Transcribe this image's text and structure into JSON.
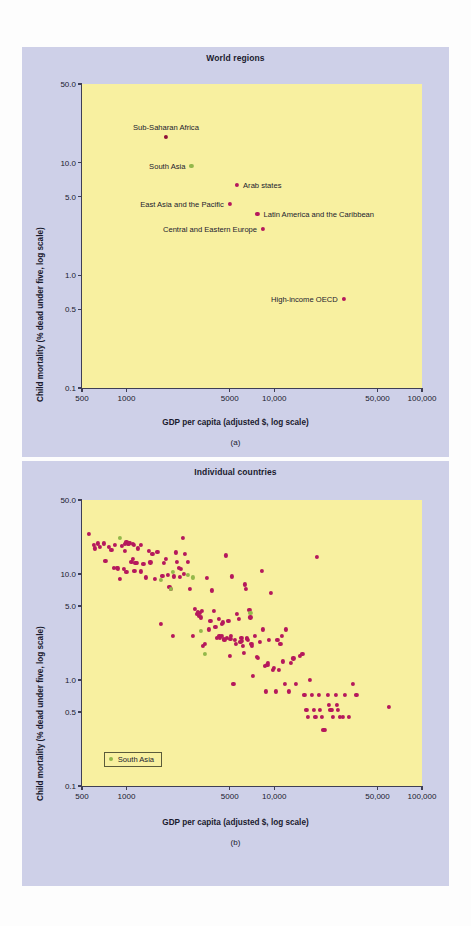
{
  "figure": {
    "background_color": "#fdfdfd",
    "panel_color": "#ced0e8",
    "plot_color": "#f8f0a0",
    "accent_red": "#b5185c",
    "accent_green": "#93b84a"
  },
  "panel_a": {
    "title": "World regions",
    "caption": "(a)",
    "xlabel": "GDP per capita (adjusted $, log scale)",
    "ylabel": "Child mortality (% dead under five, log scale)"
  },
  "panel_b": {
    "title": "Individual countries",
    "caption": "(b)",
    "xlabel": "GDP per capita (adjusted $, log scale)",
    "ylabel": "Child mortality (% dead under five, log scale)",
    "legend_label": "South Asia"
  },
  "axes": {
    "x_ticks": [
      {
        "value": 500,
        "label": "500"
      },
      {
        "value": 1000,
        "label": "1000"
      },
      {
        "value": 5000,
        "label": "5000"
      },
      {
        "value": 10000,
        "label": "10,000"
      },
      {
        "value": 50000,
        "label": "50,000"
      },
      {
        "value": 100000,
        "label": "100,000"
      }
    ],
    "y_ticks": [
      {
        "value": 50.0,
        "label": "50.0"
      },
      {
        "value": 10.0,
        "label": "10.0"
      },
      {
        "value": 5.0,
        "label": "5.0"
      },
      {
        "value": 1.0,
        "label": "1.0"
      },
      {
        "value": 0.5,
        "label": "0.5"
      },
      {
        "value": 0.1,
        "label": "0.1"
      }
    ],
    "xlim": [
      500,
      100000
    ],
    "ylim": [
      0.1,
      50.0
    ],
    "xscale": "log",
    "yscale": "log",
    "grid": false
  },
  "chart_data": [
    {
      "type": "scatter",
      "title": "World regions",
      "xlabel": "GDP per capita (adjusted $, log scale)",
      "ylabel": "Child mortality (% dead under five, log scale)",
      "xscale": "log",
      "yscale": "log",
      "xlim": [
        500,
        100000
      ],
      "ylim": [
        0.1,
        50.0
      ],
      "grid": false,
      "legend": null,
      "points": [
        {
          "label": "Sub-Saharan Africa",
          "x": 1850,
          "y": 17.0,
          "color": "#8f1038",
          "label_pos": "above"
        },
        {
          "label": "South Asia",
          "x": 2750,
          "y": 9.3,
          "color": "#93b84a",
          "label_pos": "left"
        },
        {
          "label": "Arab states",
          "x": 5600,
          "y": 6.4,
          "color": "#b5185c",
          "label_pos": "right"
        },
        {
          "label": "East Asia and the Pacific",
          "x": 5000,
          "y": 4.3,
          "color": "#b5185c",
          "label_pos": "left"
        },
        {
          "label": "Latin America and the Caribbean",
          "x": 7700,
          "y": 3.5,
          "color": "#b5185c",
          "label_pos": "right"
        },
        {
          "label": "Central and Eastern Europe",
          "x": 8400,
          "y": 2.6,
          "color": "#b5185c",
          "label_pos": "left"
        },
        {
          "label": "High-income OECD",
          "x": 29500,
          "y": 0.62,
          "color": "#b5185c",
          "label_pos": "left"
        }
      ]
    },
    {
      "type": "scatter",
      "title": "Individual countries",
      "xlabel": "GDP per capita (adjusted $, log scale)",
      "ylabel": "Child mortality (% dead under five, log scale)",
      "xscale": "log",
      "yscale": "log",
      "xlim": [
        500,
        100000
      ],
      "ylim": [
        0.1,
        50.0
      ],
      "grid": false,
      "legend": {
        "position": "lower-left",
        "entries": [
          {
            "label": "South Asia",
            "color": "#93b84a"
          }
        ]
      },
      "series": [
        {
          "name": "Other countries",
          "color": "#b5185c",
          "points": [
            [
              560,
              24.0
            ],
            [
              600,
              19.0
            ],
            [
              615,
              17.5
            ],
            [
              640,
              19.5
            ],
            [
              660,
              18.0
            ],
            [
              700,
              19.5
            ],
            [
              720,
              13.2
            ],
            [
              760,
              18.0
            ],
            [
              790,
              17.0
            ],
            [
              820,
              11.5
            ],
            [
              840,
              19.0
            ],
            [
              860,
              11.5
            ],
            [
              880,
              11.3
            ],
            [
              900,
              9.0
            ],
            [
              930,
              18.5
            ],
            [
              960,
              11.2
            ],
            [
              980,
              16.5
            ],
            [
              1000,
              20.0
            ],
            [
              1040,
              19.5
            ],
            [
              1060,
              19.8
            ],
            [
              1080,
              13.0
            ],
            [
              1100,
              14.0
            ],
            [
              1120,
              19.0
            ],
            [
              1150,
              12.8
            ],
            [
              1180,
              12.7
            ],
            [
              1200,
              17.5
            ],
            [
              1250,
              19.0
            ],
            [
              1300,
              12.5
            ],
            [
              1350,
              9.3
            ],
            [
              1420,
              16.5
            ],
            [
              1500,
              15.5
            ],
            [
              1550,
              9.0
            ],
            [
              1620,
              16.3
            ],
            [
              1700,
              3.4
            ],
            [
              1750,
              9.6
            ],
            [
              1800,
              12.8
            ],
            [
              1850,
              14.0
            ],
            [
              1900,
              9.8
            ],
            [
              1950,
              7.5
            ],
            [
              2000,
              7.3
            ],
            [
              2050,
              2.6
            ],
            [
              2100,
              9.5
            ],
            [
              2150,
              16.0
            ],
            [
              2200,
              13.0
            ],
            [
              2300,
              9.4
            ],
            [
              2350,
              11.2
            ],
            [
              2400,
              22.0
            ],
            [
              2500,
              15.5
            ],
            [
              2600,
              13.0
            ],
            [
              2700,
              7.3
            ],
            [
              2800,
              2.6
            ],
            [
              2900,
              4.7
            ],
            [
              3000,
              4.2
            ],
            [
              3100,
              4.0
            ],
            [
              3150,
              4.3
            ],
            [
              3200,
              3.9
            ],
            [
              3300,
              2.1
            ],
            [
              3400,
              2.2
            ],
            [
              3500,
              9.2
            ],
            [
              3600,
              3.0
            ],
            [
              3700,
              3.6
            ],
            [
              3800,
              7.0
            ],
            [
              3900,
              4.5
            ],
            [
              4000,
              3.2
            ],
            [
              4100,
              2.5
            ],
            [
              4200,
              3.8
            ],
            [
              4250,
              2.6
            ],
            [
              4300,
              2.5
            ],
            [
              4400,
              3.4
            ],
            [
              4500,
              3.5
            ],
            [
              4600,
              2.4
            ],
            [
              4700,
              15.0
            ],
            [
              4800,
              2.5
            ],
            [
              4900,
              3.6
            ],
            [
              5000,
              1.7
            ],
            [
              5100,
              2.6
            ],
            [
              5200,
              9.5
            ],
            [
              5300,
              0.92
            ],
            [
              5400,
              2.4
            ],
            [
              5500,
              2.2
            ],
            [
              5600,
              4.2
            ],
            [
              5800,
              3.8
            ],
            [
              5900,
              2.3
            ],
            [
              6000,
              2.5
            ],
            [
              6100,
              2.1
            ],
            [
              6200,
              1.8
            ],
            [
              6300,
              8.0
            ],
            [
              6400,
              7.2
            ],
            [
              6500,
              2.5
            ],
            [
              6600,
              2.4
            ],
            [
              6800,
              4.6
            ],
            [
              6900,
              3.9
            ],
            [
              7000,
              2.2
            ],
            [
              7200,
              1.1
            ],
            [
              7400,
              2.6
            ],
            [
              7600,
              1.65
            ],
            [
              7800,
              1.62
            ],
            [
              8000,
              2.3
            ],
            [
              8200,
              10.8
            ],
            [
              8400,
              3.0
            ],
            [
              8600,
              1.35
            ],
            [
              8800,
              0.78
            ],
            [
              9000,
              1.4
            ],
            [
              9200,
              2.4
            ],
            [
              9500,
              6.6
            ],
            [
              9800,
              1.25
            ],
            [
              10000,
              1.3
            ],
            [
              10200,
              0.78
            ],
            [
              10500,
              2.4
            ],
            [
              10800,
              1.25
            ],
            [
              11000,
              2.2
            ],
            [
              11200,
              2.6
            ],
            [
              11500,
              1.5
            ],
            [
              11800,
              0.92
            ],
            [
              12000,
              3.0
            ],
            [
              12500,
              0.78
            ],
            [
              13000,
              1.45
            ],
            [
              13500,
              1.6
            ],
            [
              14000,
              0.92
            ],
            [
              15000,
              1.7
            ],
            [
              15500,
              1.75
            ],
            [
              16000,
              0.72
            ],
            [
              16500,
              0.52
            ],
            [
              17000,
              0.45
            ],
            [
              17500,
              1.0
            ],
            [
              18000,
              0.72
            ],
            [
              18500,
              0.52
            ],
            [
              19000,
              0.45
            ],
            [
              19500,
              14.5
            ],
            [
              20000,
              0.72
            ],
            [
              20500,
              0.52
            ],
            [
              21000,
              0.45
            ],
            [
              21500,
              0.34
            ],
            [
              22000,
              0.34
            ],
            [
              23000,
              0.72
            ],
            [
              23500,
              0.58
            ],
            [
              24000,
              0.52
            ],
            [
              24500,
              0.52
            ],
            [
              25000,
              0.45
            ],
            [
              26000,
              0.72
            ],
            [
              26500,
              0.58
            ],
            [
              27000,
              0.52
            ],
            [
              28000,
              0.45
            ],
            [
              29000,
              0.45
            ],
            [
              30000,
              0.72
            ],
            [
              32000,
              0.45
            ],
            [
              34000,
              0.92
            ],
            [
              36000,
              0.72
            ],
            [
              60000,
              0.56
            ],
            [
              1000,
              10.5
            ],
            [
              1130,
              10.8
            ],
            [
              1260,
              10.6
            ],
            [
              1450,
              12.9
            ],
            [
              2250,
              11.5
            ],
            [
              2450,
              10.0
            ],
            [
              3050,
              4.4
            ],
            [
              3250,
              4.5
            ],
            [
              4450,
              2.6
            ],
            [
              4550,
              2.45
            ],
            [
              5050,
              2.45
            ],
            [
              6050,
              2.35
            ],
            [
              6550,
              2.45
            ],
            [
              7050,
              2.1
            ],
            [
              9100,
              1.45
            ],
            [
              980,
              19.2
            ],
            [
              1020,
              19.3
            ],
            [
              1105,
              19.2
            ]
          ]
        },
        {
          "name": "South Asia",
          "color": "#93b84a",
          "points": [
            [
              900,
              22.0
            ],
            [
              1700,
              8.8
            ],
            [
              2000,
              7.2
            ],
            [
              2050,
              10.5
            ],
            [
              2800,
              9.3
            ],
            [
              3400,
              1.75
            ],
            [
              3200,
              2.9
            ],
            [
              6900,
              4.3
            ],
            [
              2600,
              9.9
            ]
          ]
        }
      ]
    }
  ]
}
